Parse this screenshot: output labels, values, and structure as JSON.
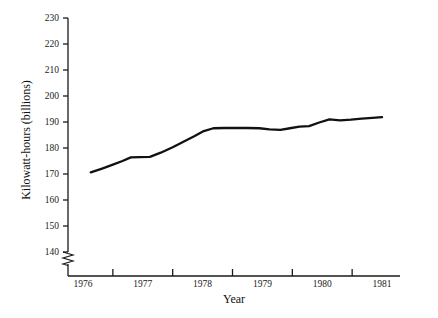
{
  "chart_data": {
    "type": "line",
    "title": "",
    "subtitle": "",
    "xlabel": "Year",
    "ylabel": "Kilowatt-hours (billions)",
    "xlim": [
      1975.75,
      1981.3
    ],
    "ylim": [
      140,
      230
    ],
    "y_axis_broken": true,
    "y_break_symbol": "zigzag",
    "grid": false,
    "legend": null,
    "legend_position": "none",
    "yticks": [
      140,
      150,
      160,
      170,
      180,
      190,
      200,
      210,
      220,
      230
    ],
    "ytick_labels": [
      "140",
      "150",
      "160",
      "170",
      "180",
      "190",
      "200",
      "210",
      "220",
      "230"
    ],
    "xticks": [
      1976.5,
      1977.5,
      1978.5,
      1979.5,
      1980.5
    ],
    "xtick_labels": [],
    "x_category_labels": [
      "1976",
      "1977",
      "1978",
      "1979",
      "1980",
      "1981"
    ],
    "x_category_positions": [
      1976,
      1977,
      1978,
      1979,
      1980,
      1981
    ],
    "series": [
      {
        "name": "Kilowatt-hours",
        "color": "#111111",
        "x": [
          1976.13,
          1976.32,
          1976.5,
          1976.66,
          1976.8,
          1976.95,
          1977.12,
          1977.3,
          1977.5,
          1977.68,
          1977.86,
          1978.02,
          1978.18,
          1978.36,
          1978.55,
          1978.75,
          1978.95,
          1979.12,
          1979.3,
          1979.46,
          1979.62,
          1979.78,
          1979.95,
          1980.12,
          1980.3,
          1980.48,
          1980.66,
          1980.84,
          1981.0
        ],
        "y": [
          170.6,
          172.1,
          173.6,
          175.0,
          176.4,
          176.5,
          176.6,
          178.2,
          180.3,
          182.4,
          184.5,
          186.5,
          187.6,
          187.7,
          187.7,
          187.7,
          187.6,
          187.2,
          187.0,
          187.6,
          188.2,
          188.4,
          189.8,
          191.0,
          190.6,
          190.9,
          191.3,
          191.6,
          191.9
        ]
      }
    ]
  },
  "axis_titles": {
    "x": "Year",
    "y": "Kilowatt-hours (billions)"
  }
}
